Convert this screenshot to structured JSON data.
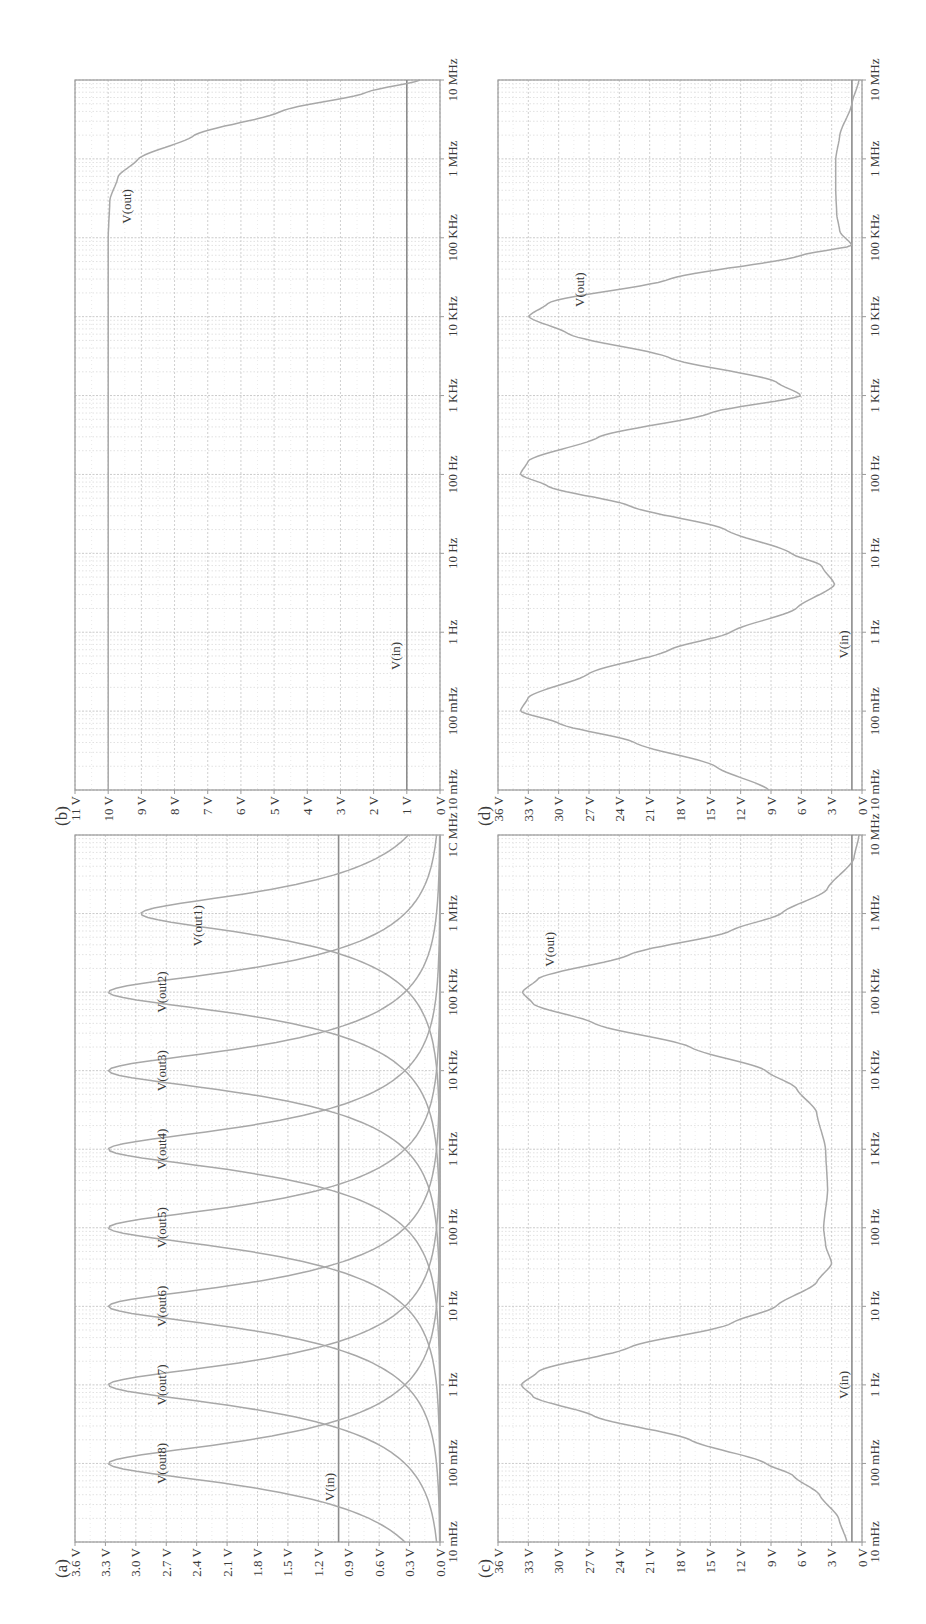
{
  "figure": {
    "orientation": "rotated-90-ccw",
    "colors": {
      "grid_major": "#c4c4c4",
      "grid_minor": "#d6d6d6",
      "frame": "#9a9a9a",
      "trace": "#a8a8a8",
      "vin": "#8c8c8c",
      "text": "#3a3a3a"
    }
  },
  "panels": [
    {
      "id": "a",
      "label": "(a)"
    },
    {
      "id": "b",
      "label": "(b)"
    },
    {
      "id": "c",
      "label": "(c)"
    },
    {
      "id": "d",
      "label": "(d)"
    }
  ],
  "chart_data": [
    {
      "panel": "(a)",
      "type": "line",
      "title": "",
      "xlabel": "Frequency",
      "ylabel": "Voltage",
      "xscale": "log",
      "xlim": [
        0.01,
        10000000
      ],
      "ylim": [
        0,
        3.6
      ],
      "x_ticks": [
        "10 mHz",
        "100 mHz",
        "1 Hz",
        "10 Hz",
        "100 Hz",
        "1 KHz",
        "10 KHz",
        "100 KHz",
        "1 MHz",
        "1C MHz"
      ],
      "y_ticks": [
        "3.6 V",
        "3.3 V",
        "3.0 V",
        "2.7 V",
        "2.4 V",
        "2.1 V",
        "1.8 V",
        "1.5 V",
        "1.2 V",
        "0.9 V",
        "0.6 V",
        "0.3 V",
        "0.0 V"
      ],
      "grid": true,
      "series": [
        {
          "name": "V(in)",
          "x": [
            0.01,
            10000000
          ],
          "values": [
            1.0,
            1.0
          ]
        },
        {
          "name": "V(out8)",
          "center_hz": 0.1,
          "peak_v": 3.27
        },
        {
          "name": "V(out7)",
          "center_hz": 1,
          "peak_v": 3.27
        },
        {
          "name": "V(out6)",
          "center_hz": 10,
          "peak_v": 3.27
        },
        {
          "name": "V(out5)",
          "center_hz": 100,
          "peak_v": 3.27
        },
        {
          "name": "V(out4)",
          "center_hz": 1000,
          "peak_v": 3.27
        },
        {
          "name": "V(out3)",
          "center_hz": 10000,
          "peak_v": 3.27
        },
        {
          "name": "V(out2)",
          "center_hz": 100000,
          "peak_v": 3.27
        },
        {
          "name": "V(out1)",
          "center_hz": 1000000,
          "peak_v": 2.95
        }
      ],
      "annotations": [
        {
          "text": "V(in)",
          "x_hz": 0.05,
          "y_v": 1.05
        },
        {
          "text": "V(out8)",
          "x_hz": 0.1,
          "y_v": 2.7
        },
        {
          "text": "V(out7)",
          "x_hz": 1,
          "y_v": 2.7
        },
        {
          "text": "V(out6)",
          "x_hz": 10,
          "y_v": 2.7
        },
        {
          "text": "V(out5)",
          "x_hz": 100,
          "y_v": 2.7
        },
        {
          "text": "V(out4)",
          "x_hz": 1000,
          "y_v": 2.7
        },
        {
          "text": "V(out3)",
          "x_hz": 10000,
          "y_v": 2.7
        },
        {
          "text": "V(out2)",
          "x_hz": 100000,
          "y_v": 2.7
        },
        {
          "text": "V(out1)",
          "x_hz": 700000,
          "y_v": 2.35
        }
      ]
    },
    {
      "panel": "(b)",
      "type": "line",
      "xscale": "log",
      "xlim": [
        0.01,
        10000000
      ],
      "ylim": [
        0,
        11
      ],
      "x_ticks": [
        "10 mHz",
        "100 mHz",
        "1 Hz",
        "10 Hz",
        "100 Hz",
        "1 KHz",
        "10 KHz",
        "100 KHz",
        "1 MHz",
        "10 MHz"
      ],
      "y_ticks": [
        "11 V",
        "10 V",
        "9 V",
        "8 V",
        "7 V",
        "6 V",
        "5 V",
        "4 V",
        "3 V",
        "2 V",
        "1 V",
        "0 V"
      ],
      "grid": true,
      "series": [
        {
          "name": "V(in)",
          "x": [
            0.01,
            10000000
          ],
          "values": [
            1.0,
            1.0
          ]
        },
        {
          "name": "V(out)",
          "x": [
            0.01,
            1,
            100,
            10000,
            100000,
            300000,
            600000,
            1000000,
            2000000,
            4000000,
            7000000,
            10000000
          ],
          "values": [
            10.0,
            10.0,
            10.0,
            10.0,
            10.0,
            9.95,
            9.7,
            9.1,
            7.4,
            4.8,
            2.2,
            0.6
          ]
        }
      ],
      "annotations": [
        {
          "text": "V(in)",
          "x_hz": 0.5,
          "y_v": 1.2
        },
        {
          "text": "V(out)",
          "x_hz": 250000,
          "y_v": 9.3
        }
      ]
    },
    {
      "panel": "(c)",
      "type": "line",
      "xscale": "log",
      "xlim": [
        0.01,
        10000000
      ],
      "ylim": [
        0,
        36
      ],
      "x_ticks": [
        "10 mHz",
        "100 mHz",
        "1 Hz",
        "10 Hz",
        "100 Hz",
        "1 KHz",
        "10 KHz",
        "100 KHz",
        "1 MHz",
        "10 MHz"
      ],
      "y_ticks": [
        "36 V",
        "33 V",
        "30 V",
        "27 V",
        "24 V",
        "21 V",
        "18 V",
        "15 V",
        "12 V",
        "9 V",
        "6 V",
        "3 V",
        "0 V"
      ],
      "grid": true,
      "series": [
        {
          "name": "V(in)",
          "x": [
            0.01,
            10000000
          ],
          "values": [
            1.0,
            1.0
          ]
        },
        {
          "name": "V(out)",
          "x": [
            0.01,
            0.02,
            0.04,
            0.07,
            0.1,
            0.2,
            0.4,
            0.7,
            1,
            1.5,
            3,
            6,
            10,
            20,
            35,
            60,
            100,
            300,
            1000,
            3000,
            6000,
            10000,
            20000,
            40000,
            70000,
            100000,
            150000,
            300000,
            600000,
            1000000,
            2000000,
            5000000,
            10000000
          ],
          "values": [
            1.5,
            2.3,
            4.2,
            6.8,
            9.5,
            17.0,
            26.5,
            32.5,
            33.7,
            32.0,
            23.0,
            13.0,
            8.5,
            4.5,
            3.0,
            3.6,
            3.8,
            3.4,
            3.6,
            4.5,
            6.5,
            9.5,
            17.0,
            26.5,
            32.5,
            33.6,
            32.0,
            23.0,
            13.0,
            8.0,
            3.5,
            0.8,
            0.3
          ]
        }
      ],
      "annotations": [
        {
          "text": "V(in)",
          "x_hz": 1,
          "y_v": 1.4
        },
        {
          "text": "V(out)",
          "x_hz": 350000,
          "y_v": 30.5
        }
      ]
    },
    {
      "panel": "(d)",
      "type": "line",
      "xscale": "log",
      "xlim": [
        0.01,
        10000000
      ],
      "ylim": [
        0,
        36
      ],
      "x_ticks": [
        "10 mHz",
        "100 mHz",
        "1 Hz",
        "10 Hz",
        "100 Hz",
        "1 KHz",
        "10 KHz",
        "100 KHz",
        "1 MHz",
        "10 MHz"
      ],
      "y_ticks": [
        "36 V",
        "33 V",
        "30 V",
        "27 V",
        "24 V",
        "21 V",
        "18 V",
        "15 V",
        "12 V",
        "9 V",
        "6 V",
        "3 V",
        "0 V"
      ],
      "grid": true,
      "series": [
        {
          "name": "V(in)",
          "x": [
            0.01,
            10000000
          ],
          "values": [
            1.0,
            1.0
          ]
        },
        {
          "name": "V(out)",
          "x": [
            0.01,
            0.02,
            0.04,
            0.07,
            0.1,
            0.15,
            0.3,
            0.6,
            1,
            2,
            4,
            7,
            10,
            20,
            40,
            70,
            100,
            150,
            300,
            600,
            1000,
            1500,
            3000,
            6000,
            10000,
            15000,
            30000,
            60000,
            80000,
            120000,
            200000,
            400000,
            1000000,
            2000000,
            5000000,
            10000000
          ],
          "values": [
            9.2,
            14.5,
            22.5,
            30.0,
            33.8,
            33.0,
            27.0,
            19.0,
            13.0,
            6.5,
            2.7,
            4.0,
            7.0,
            13.5,
            23.0,
            31.0,
            33.8,
            33.0,
            26.0,
            15.0,
            6.0,
            8.5,
            19.0,
            29.0,
            33.0,
            31.0,
            19.0,
            6.0,
            1.0,
            2.2,
            2.5,
            2.6,
            2.6,
            2.2,
            1.0,
            0.3
          ]
        }
      ],
      "annotations": [
        {
          "text": "V(in)",
          "x_hz": 0.7,
          "y_v": 1.4
        },
        {
          "text": "V(out)",
          "x_hz": 22000,
          "y_v": 27.5
        }
      ]
    }
  ]
}
